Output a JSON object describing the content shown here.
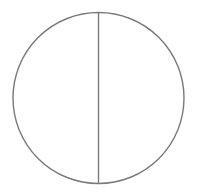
{
  "diagram": {
    "type": "circle-divided-by-diameter",
    "canvas": {
      "width": 197,
      "height": 193,
      "background": "#ffffff"
    },
    "circle": {
      "cx": 98.5,
      "cy": 98,
      "r": 85.5,
      "stroke": "#7a7a7a",
      "stroke_width": 1.4,
      "fill": "none"
    },
    "diameter": {
      "x1": 98.5,
      "y1": 12.5,
      "x2": 98.5,
      "y2": 183.5,
      "orientation": "vertical",
      "stroke": "#7a7a7a",
      "stroke_width": 1.4
    },
    "regions": [
      {
        "name": "left-half"
      },
      {
        "name": "right-half"
      }
    ]
  }
}
